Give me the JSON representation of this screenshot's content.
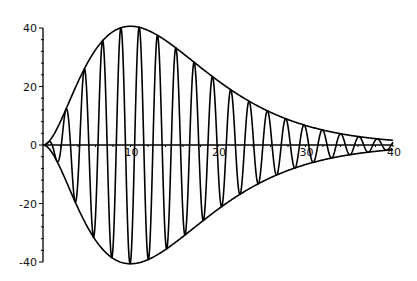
{
  "chart_data": {
    "type": "line",
    "title": "",
    "xlabel": "",
    "ylabel": "",
    "xlim": [
      0,
      40
    ],
    "ylim": [
      -40,
      40
    ],
    "grid": false,
    "legend": null,
    "x_ticks": [
      10,
      20,
      30,
      40
    ],
    "x_tick_labels": [
      "10",
      "20",
      "30",
      "40"
    ],
    "y_ticks": [
      -40,
      -20,
      0,
      20,
      40
    ],
    "y_tick_labels": [
      "-40",
      "-20",
      "0",
      "20",
      "40"
    ],
    "series": [
      {
        "name": "upper envelope",
        "formula": "3*x^2*exp(-x/5)",
        "x": [
          0,
          5,
          10,
          15,
          20,
          25,
          30,
          35,
          40
        ],
        "values": [
          0,
          27.59,
          40.6,
          33.61,
          21.98,
          12.63,
          6.69,
          3.35,
          1.61
        ]
      },
      {
        "name": "lower envelope",
        "formula": "-3*x^2*exp(-x/5)",
        "x": [
          0,
          5,
          10,
          15,
          20,
          25,
          30,
          35,
          40
        ],
        "values": [
          0,
          -27.59,
          -40.6,
          -33.61,
          -21.98,
          -12.63,
          -6.69,
          -3.35,
          -1.61
        ]
      },
      {
        "name": "damped oscillation",
        "formula": "3*x^2*exp(-x/5)*sin(3*x)",
        "amplitude": 3,
        "decay": 5,
        "frequency": 3
      }
    ],
    "line_color": "#000000"
  },
  "plot": {
    "origin_px": [
      43,
      145
    ],
    "x_px_per_unit": 8.75,
    "y_px_per_unit": 2.925
  }
}
